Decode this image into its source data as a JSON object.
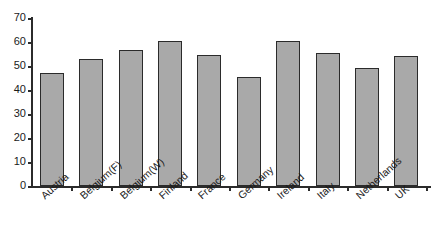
{
  "chart_data": {
    "type": "bar",
    "title": "",
    "subtitle": "",
    "xlabel": "",
    "ylabel": "",
    "categories": [
      "Austria",
      "Belgium(F)",
      "Belgium(W)",
      "Finland",
      "France",
      "Germany",
      "Ireland",
      "Italy",
      "Netherlands",
      "UK"
    ],
    "values": [
      47,
      53,
      56.5,
      60.5,
      54.5,
      45.5,
      60.5,
      55.5,
      49,
      54
    ],
    "series": [
      {
        "name": "",
        "values": [
          47,
          53,
          56.5,
          60.5,
          54.5,
          45.5,
          60.5,
          55.5,
          49,
          54
        ]
      }
    ],
    "ylim": [
      0,
      70
    ],
    "ytick_values": [
      0,
      10,
      20,
      30,
      40,
      50,
      60,
      70
    ],
    "ytick_labels": [
      "0",
      "10",
      "20",
      "30",
      "40",
      "50",
      "60",
      "70"
    ],
    "grid": false,
    "legend": false,
    "legend_position": "none",
    "annotations": [],
    "bar_fill_color": "#a9a9a9",
    "bar_border_color": "#2b2b2b",
    "axis_color": "#2b2b2b",
    "background_color": "#ffffff",
    "xtick_rotation": -42
  }
}
